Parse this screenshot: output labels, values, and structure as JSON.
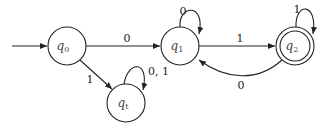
{
  "diagram": {
    "type": "finite-automaton",
    "states": [
      {
        "id": "q0",
        "name": "q",
        "sub": "0",
        "start": true,
        "accept": false
      },
      {
        "id": "q1",
        "name": "q",
        "sub": "1",
        "start": false,
        "accept": false
      },
      {
        "id": "q2",
        "name": "q",
        "sub": "2",
        "start": false,
        "accept": true
      },
      {
        "id": "qt",
        "name": "q",
        "sub": "t",
        "start": false,
        "accept": false
      }
    ],
    "transitions": [
      {
        "from": "q0",
        "to": "q1",
        "label": "0"
      },
      {
        "from": "q0",
        "to": "qt",
        "label": "1"
      },
      {
        "from": "qt",
        "to": "qt",
        "label": "0, 1"
      },
      {
        "from": "q1",
        "to": "q1",
        "label": "0"
      },
      {
        "from": "q1",
        "to": "q2",
        "label": "1"
      },
      {
        "from": "q2",
        "to": "q2",
        "label": "1"
      },
      {
        "from": "q2",
        "to": "q1",
        "label": "0"
      }
    ]
  }
}
